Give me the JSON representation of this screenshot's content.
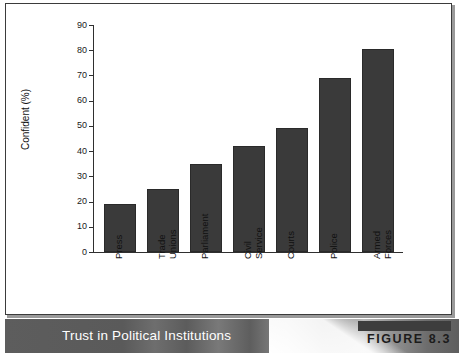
{
  "figure": {
    "caption_title": "Trust in Political Institutions",
    "badge_label": "FIGURE 8.3"
  },
  "chart_data": {
    "type": "bar",
    "title": "Trust in Political Institutions",
    "xlabel": "",
    "ylabel": "Confident (%)",
    "ylim": [
      0,
      90
    ],
    "ytick_step": 10,
    "grid": false,
    "legend": "none",
    "bar_color": "#3a3a3a",
    "categories": [
      "Press",
      "Trade\nUnions",
      "Parliament",
      "Civil\nService",
      "Courts",
      "Police",
      "Armed\nForces"
    ],
    "values": [
      19,
      25,
      35,
      42,
      49,
      69,
      80.5
    ],
    "yticks": [
      "0",
      "10",
      "20",
      "30",
      "40",
      "50",
      "60",
      "70",
      "80",
      "90"
    ]
  }
}
